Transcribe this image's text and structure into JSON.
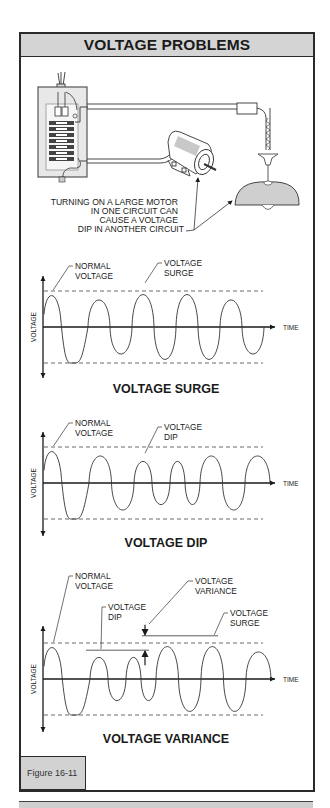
{
  "figure": {
    "title": "VOLTAGE PROBLEMS",
    "figure_label": "Figure 16-11",
    "colors": {
      "header_fill": "#d4d4d4",
      "border": "#2a2a2a",
      "shade": "#c8c8c8"
    }
  },
  "illustration": {
    "components": [
      "service-panel",
      "circuit-breakers",
      "motor",
      "pendant-lamp"
    ],
    "caption_lines": [
      "TURNING ON A LARGE MOTOR",
      "IN ONE CIRCUIT CAN",
      "CAUSE A VOLTAGE",
      "DIP IN ANOTHER CIRCUIT"
    ]
  },
  "chart_data": [
    {
      "type": "line",
      "title": "VOLTAGE SURGE",
      "xlabel": "TIME",
      "ylabel": "VOLTAGE",
      "normal_amplitude": 1.0,
      "cycles": [
        {
          "peak": 1.0,
          "trough": -1.0
        },
        {
          "peak": 1.0,
          "trough": -1.0
        },
        {
          "peak": 1.2,
          "trough": -1.2
        },
        {
          "peak": 1.2,
          "trough": -1.2
        },
        {
          "peak": 1.0,
          "trough": -1.0
        }
      ],
      "annotations": [
        {
          "text_lines": [
            "NORMAL",
            "VOLTAGE"
          ],
          "target_cycle": 0
        },
        {
          "text_lines": [
            "VOLTAGE",
            "SURGE"
          ],
          "target_cycle": 2
        }
      ],
      "reference_lines": [
        1.0,
        -1.0
      ]
    },
    {
      "type": "line",
      "title": "VOLTAGE DIP",
      "xlabel": "TIME",
      "ylabel": "VOLTAGE",
      "normal_amplitude": 1.0,
      "cycles": [
        {
          "peak": 1.0,
          "trough": -1.0
        },
        {
          "peak": 1.0,
          "trough": -1.0
        },
        {
          "peak": 0.8,
          "trough": -0.8
        },
        {
          "peak": 0.8,
          "trough": -0.8
        },
        {
          "peak": 1.0,
          "trough": -1.0
        },
        {
          "peak": 1.0,
          "trough": 0
        }
      ],
      "annotations": [
        {
          "text_lines": [
            "NORMAL",
            "VOLTAGE"
          ],
          "target_cycle": 0
        },
        {
          "text_lines": [
            "VOLTAGE",
            "DIP"
          ],
          "target_cycle": 2
        }
      ],
      "reference_lines": [
        1.0,
        -1.0
      ]
    },
    {
      "type": "line",
      "title": "VOLTAGE VARIANCE",
      "xlabel": "TIME",
      "ylabel": "VOLTAGE",
      "normal_amplitude": 1.0,
      "cycles": [
        {
          "peak": 1.0,
          "trough": -1.0
        },
        {
          "peak": 0.8,
          "trough": -0.8
        },
        {
          "peak": 0.8,
          "trough": -0.8
        },
        {
          "peak": 1.2,
          "trough": -1.2
        },
        {
          "peak": 1.2,
          "trough": -1.2
        },
        {
          "peak": 1.0,
          "trough": 0
        }
      ],
      "annotations": [
        {
          "text_lines": [
            "NORMAL",
            "VOLTAGE"
          ],
          "target_cycle": 0
        },
        {
          "text_lines": [
            "VOLTAGE",
            "DIP"
          ],
          "target_cycle": 1
        },
        {
          "text_lines": [
            "VOLTAGE",
            "VARIANCE"
          ],
          "target_cycle": "between-dip-and-surge"
        },
        {
          "text_lines": [
            "VOLTAGE",
            "SURGE"
          ],
          "target_cycle": 4
        }
      ],
      "reference_lines": [
        1.0,
        -1.0
      ]
    }
  ]
}
